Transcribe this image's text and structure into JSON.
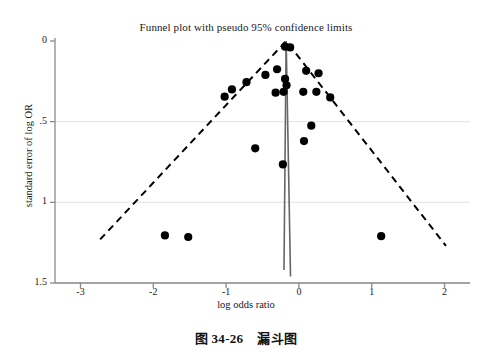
{
  "chart_data": {
    "type": "scatter",
    "title": "Funnel plot with pseudo 95% confidence limits",
    "xlabel": "log odds ratio",
    "ylabel": "standard error of log OR",
    "xlim": [
      -3.35,
      2.35
    ],
    "ylim": [
      0,
      1.5
    ],
    "y_inverted": true,
    "grid": "horizontal-faint",
    "legend": "none",
    "xticks": [
      -3,
      -2,
      -1,
      0,
      1,
      2
    ],
    "xtick_labels": [
      "-3",
      "-2",
      "-1",
      "0",
      "1",
      "2"
    ],
    "yticks": [
      0,
      0.5,
      1,
      1.5
    ],
    "ytick_labels": [
      "0",
      ".5",
      "1",
      "1.5"
    ],
    "series": [
      {
        "name": "studies",
        "marker": "filled-circle",
        "color": "#000000",
        "points": [
          {
            "x": -0.19,
            "y": 0.035
          },
          {
            "x": -0.12,
            "y": 0.04
          },
          {
            "x": -0.3,
            "y": 0.175
          },
          {
            "x": -0.46,
            "y": 0.21
          },
          {
            "x": -0.72,
            "y": 0.255
          },
          {
            "x": -0.92,
            "y": 0.3
          },
          {
            "x": -1.02,
            "y": 0.345
          },
          {
            "x": -0.19,
            "y": 0.235
          },
          {
            "x": -0.17,
            "y": 0.275
          },
          {
            "x": -0.21,
            "y": 0.315
          },
          {
            "x": -0.32,
            "y": 0.32
          },
          {
            "x": 0.1,
            "y": 0.185
          },
          {
            "x": 0.27,
            "y": 0.2
          },
          {
            "x": 0.06,
            "y": 0.315
          },
          {
            "x": 0.24,
            "y": 0.315
          },
          {
            "x": 0.43,
            "y": 0.35
          },
          {
            "x": 0.17,
            "y": 0.525
          },
          {
            "x": 0.07,
            "y": 0.62
          },
          {
            "x": -0.6,
            "y": 0.665
          },
          {
            "x": -0.22,
            "y": 0.765
          },
          {
            "x": -1.84,
            "y": 1.205
          },
          {
            "x": -1.52,
            "y": 1.215
          },
          {
            "x": 1.13,
            "y": 1.21
          }
        ]
      }
    ],
    "reference_lines": [
      {
        "name": "pseudo-95-confidence-limits",
        "style": "dashed",
        "color": "#000000",
        "apex": {
          "x": -0.175,
          "y": 0.0
        },
        "left_end": {
          "x": -2.73,
          "y": 1.23
        },
        "right_end": {
          "x": 2.02,
          "y": 1.27
        }
      },
      {
        "name": "pooled-effect-line-left",
        "style": "solid",
        "color": "#666666",
        "from": {
          "x": -0.175,
          "y": 0.0
        },
        "to": {
          "x": -0.205,
          "y": 1.42
        }
      },
      {
        "name": "pooled-effect-line-right",
        "style": "solid",
        "color": "#666666",
        "from": {
          "x": -0.175,
          "y": 0.0
        },
        "to": {
          "x": -0.115,
          "y": 1.46
        }
      }
    ]
  },
  "caption": {
    "figure_number": "图 34-26",
    "figure_title": "漏斗图"
  }
}
